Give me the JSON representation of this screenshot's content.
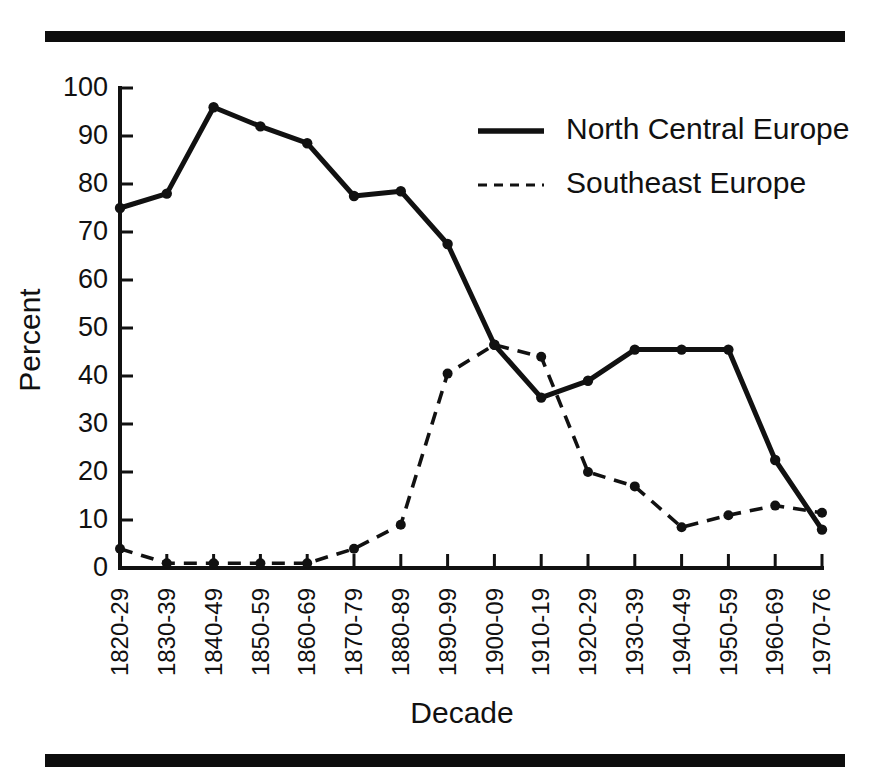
{
  "figure": {
    "top_rule": "horizontal-rule",
    "bottom_rule": "horizontal-rule"
  },
  "chart_data": {
    "type": "line",
    "title": "",
    "xlabel": "Decade",
    "ylabel": "Percent",
    "ylim": [
      0,
      100
    ],
    "yticks": [
      0,
      10,
      20,
      30,
      40,
      50,
      60,
      70,
      80,
      90,
      100
    ],
    "grid": false,
    "legend_position": "upper right",
    "categories": [
      "1820-29",
      "1830-39",
      "1840-49",
      "1850-59",
      "1860-69",
      "1870-79",
      "1880-89",
      "1890-99",
      "1900-09",
      "1910-19",
      "1920-29",
      "1930-39",
      "1940-49",
      "1950-59",
      "1960-69",
      "1970-76"
    ],
    "series": [
      {
        "name": "North Central Europe",
        "style": "solid",
        "values": [
          75,
          78,
          96,
          92,
          88.5,
          77.5,
          78.5,
          67.5,
          46.5,
          35.5,
          39,
          45.5,
          45.5,
          45.5,
          22.5,
          8
        ]
      },
      {
        "name": "Southeast Europe",
        "style": "dashed",
        "values": [
          4,
          1,
          1,
          1,
          1,
          4,
          9,
          40.5,
          46.5,
          44,
          20,
          17,
          8.5,
          11,
          13,
          11.5
        ]
      }
    ]
  },
  "legend": {
    "entries": [
      {
        "label": "North Central Europe",
        "style": "solid"
      },
      {
        "label": "Southeast Europe",
        "style": "dashed"
      }
    ]
  }
}
